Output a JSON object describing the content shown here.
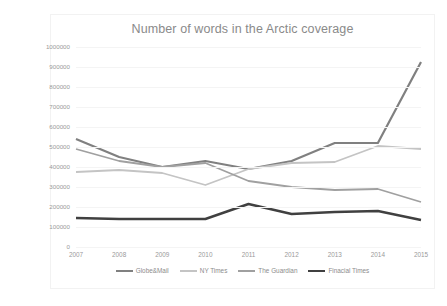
{
  "chart_data": {
    "type": "line",
    "title": "Number of words in the Arctic coverage",
    "xlabel": "",
    "ylabel": "",
    "categories": [
      "2007",
      "2008",
      "2009",
      "2010",
      "2011",
      "2012",
      "2013",
      "2014",
      "2015"
    ],
    "ylim": [
      0,
      1000000
    ],
    "ytick_step": 100000,
    "yticks": [
      "1000000",
      "900000",
      "800000",
      "700000",
      "600000",
      "500000",
      "400000",
      "300000",
      "200000",
      "100000",
      "0"
    ],
    "grid": true,
    "legend_position": "bottom",
    "series": [
      {
        "name": "Globe&Mail",
        "color": "#808080",
        "width": 2.2,
        "values": [
          540000,
          450000,
          400000,
          430000,
          390000,
          430000,
          520000,
          520000,
          925000
        ]
      },
      {
        "name": "NY Times",
        "color": "#c4c4c4",
        "width": 1.8,
        "values": [
          375000,
          385000,
          370000,
          310000,
          390000,
          420000,
          425000,
          505000,
          490000
        ]
      },
      {
        "name": "The Guardian",
        "color": "#a0a0a0",
        "width": 1.8,
        "values": [
          490000,
          430000,
          400000,
          420000,
          330000,
          300000,
          285000,
          290000,
          225000
        ]
      },
      {
        "name": "Finacial Times",
        "color": "#404040",
        "width": 2.4,
        "values": [
          145000,
          140000,
          140000,
          140000,
          215000,
          165000,
          175000,
          180000,
          135000
        ]
      }
    ]
  },
  "colors": {
    "title_text": "#8a8a8a",
    "axis_text": "#9a9a9a",
    "gridline": "#f4f4f4",
    "frame_border": "#f2f2f2",
    "background": "#ffffff"
  }
}
